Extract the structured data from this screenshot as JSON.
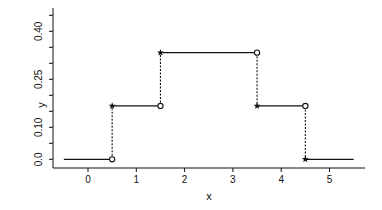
{
  "chart_data": {
    "type": "line",
    "subtype": "step-function",
    "title": "",
    "xlabel": "x",
    "ylabel": "y",
    "xlim": [
      -0.5,
      5.5
    ],
    "ylim": [
      0,
      0.45
    ],
    "x_ticks": [
      0,
      1,
      2,
      3,
      4,
      5
    ],
    "x_tick_labels": [
      "0",
      "1",
      "2",
      "3",
      "4",
      "5"
    ],
    "y_ticks": [
      0.0,
      0.05,
      0.1,
      0.15,
      0.2,
      0.25,
      0.3,
      0.35,
      0.4,
      0.45
    ],
    "y_tick_labels": [
      {
        "value": 0.0,
        "label": "0.0"
      },
      {
        "value": 0.1,
        "label": "0.10"
      },
      {
        "value": 0.25,
        "label": "0.25"
      },
      {
        "value": 0.4,
        "label": "0.40"
      }
    ],
    "grid": false,
    "legend": null,
    "segments": [
      {
        "x_start": -0.5,
        "x_end": 0.5,
        "y": 0.0
      },
      {
        "x_start": 0.5,
        "x_end": 1.5,
        "y": 0.1667
      },
      {
        "x_start": 1.5,
        "x_end": 3.5,
        "y": 0.3333
      },
      {
        "x_start": 3.5,
        "x_end": 4.5,
        "y": 0.1667
      },
      {
        "x_start": 4.5,
        "x_end": 5.5,
        "y": 0.0
      }
    ],
    "jumps": [
      {
        "x": 0.5,
        "from": 0.0,
        "to": 0.1667
      },
      {
        "x": 1.5,
        "from": 0.1667,
        "to": 0.3333
      },
      {
        "x": 3.5,
        "from": 0.3333,
        "to": 0.1667
      },
      {
        "x": 4.5,
        "from": 0.1667,
        "to": 0.0
      }
    ],
    "markers": {
      "closed_star": "included endpoint (segment start)",
      "open_circle": "excluded endpoint (segment end)"
    },
    "colors": {
      "line": "#111111",
      "axis": "#111111",
      "background": "#ffffff"
    }
  }
}
